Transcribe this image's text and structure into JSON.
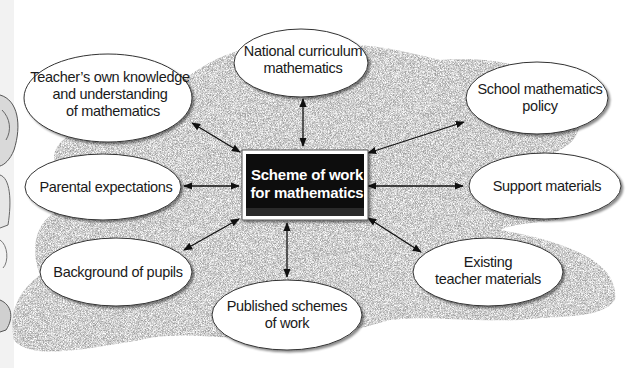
{
  "diagram": {
    "type": "mind-map",
    "center": {
      "line1": "Scheme of work",
      "line2": "for mathematics"
    },
    "nodes": [
      {
        "id": "teachers-knowledge",
        "lines": [
          "Teacher’s own knowledge",
          "and understanding",
          "of mathematics"
        ]
      },
      {
        "id": "national-curriculum",
        "lines": [
          "National curriculum",
          "mathematics"
        ]
      },
      {
        "id": "school-policy",
        "lines": [
          "School mathematics",
          "policy"
        ]
      },
      {
        "id": "parental-expectations",
        "lines": [
          "Parental expectations"
        ]
      },
      {
        "id": "support-materials",
        "lines": [
          "Support materials"
        ]
      },
      {
        "id": "background-of-pupils",
        "lines": [
          "Background of pupils"
        ]
      },
      {
        "id": "existing-teacher-materials",
        "lines": [
          "Existing",
          "teacher materials"
        ]
      },
      {
        "id": "published-schemes",
        "lines": [
          "Published schemes",
          "of work"
        ]
      }
    ],
    "connections": "bidirectional arrows from each node to the center box",
    "colors": {
      "background_texture": "#bdbdbd",
      "center_box": "#0d0d0d",
      "center_text": "#ffffff",
      "ellipse_fill": "#ffffff",
      "ellipse_stroke": "#333333"
    }
  }
}
